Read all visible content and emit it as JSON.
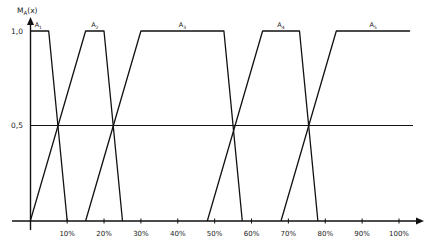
{
  "chart_data": {
    "type": "line",
    "title": "",
    "xlabel": "",
    "ylabel": "M_A(x)",
    "xlim": [
      0,
      105
    ],
    "ylim": [
      0,
      1
    ],
    "grid": false,
    "legend": "none (series labeled inline above each plateau)",
    "x_tick_labels": [
      "10%",
      "20%",
      "30%",
      "40%",
      "50%",
      "60%",
      "70%",
      "80%",
      "90%",
      "100%"
    ],
    "x_ticks": [
      10,
      20,
      30,
      40,
      50,
      60,
      70,
      80,
      90,
      100
    ],
    "y_tick_labels": [
      "1,0",
      "0,5"
    ],
    "y_ticks": [
      1.0,
      0.5
    ],
    "reference_lines": [
      {
        "y": 0.5,
        "from_x": 0,
        "to_x": 104
      }
    ],
    "series": [
      {
        "name": "A1",
        "x": [
          0,
          5,
          10
        ],
        "y": [
          1,
          1,
          0
        ]
      },
      {
        "name": "A2",
        "x": [
          0,
          15,
          20,
          25
        ],
        "y": [
          0,
          1,
          1,
          0
        ]
      },
      {
        "name": "A3",
        "x": [
          15,
          30,
          52.5,
          57.5
        ],
        "y": [
          0,
          1,
          1,
          0
        ]
      },
      {
        "name": "A4",
        "x": [
          48,
          63,
          73,
          78
        ],
        "y": [
          0,
          1,
          1,
          0
        ]
      },
      {
        "name": "A5",
        "x": [
          68,
          83,
          103
        ],
        "y": [
          0,
          1,
          1
        ]
      }
    ]
  },
  "labels": {
    "y_axis": "M",
    "y_axis_sub": "A",
    "y_axis_suffix": "(x)",
    "y_one": "1,0",
    "y_half": "0,5",
    "series": [
      {
        "base": "A",
        "sub": "1"
      },
      {
        "base": "A",
        "sub": "2"
      },
      {
        "base": "A",
        "sub": "3"
      },
      {
        "base": "A",
        "sub": "4"
      },
      {
        "base": "A",
        "sub": "5"
      }
    ],
    "x_ticks": [
      "10%",
      "20%",
      "30%",
      "40%",
      "50%",
      "60%",
      "70%",
      "80%",
      "90%",
      "100%"
    ]
  }
}
